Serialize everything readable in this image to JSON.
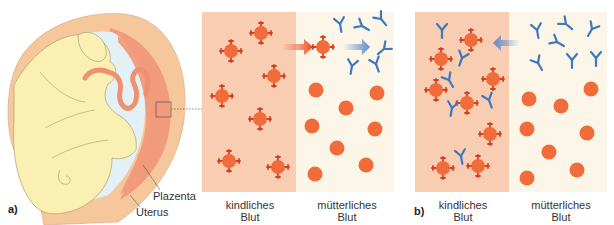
{
  "figure": {
    "part_a_label": "a)",
    "part_b_label": "b)",
    "annotations": {
      "placenta": "Plazenta",
      "uterus": "Uterus"
    },
    "colors": {
      "child_blood_bg": "#f9cdb1",
      "mother_blood_bg": "#fcf6e9",
      "red_cell": "#f26b3a",
      "red_cell_spike": "#d8401c",
      "antibody": "#3f79bd",
      "arrow_red": "#f04a22",
      "arrow_blue": "#5d8cc8",
      "fetus_skin": "#fbf0b4",
      "uterus_wall": "#f6c79a",
      "placenta": "#f19a7c",
      "amniotic": "#e3f1f7"
    },
    "panel_a": {
      "child_label_line1": "kindliches",
      "child_label_line2": "Blut",
      "mother_label_line1": "mütterliches",
      "mother_label_line2": "Blut",
      "description": "Rhesus-positive fetal red cells cross into maternal blood; maternal antibodies form"
    },
    "panel_b": {
      "child_label_line1": "kindliches",
      "child_label_line2": "Blut",
      "mother_label_line1": "mütterliches",
      "mother_label_line2": "Blut",
      "description": "Maternal antibodies cross the placenta and bind fetal red cells"
    }
  }
}
